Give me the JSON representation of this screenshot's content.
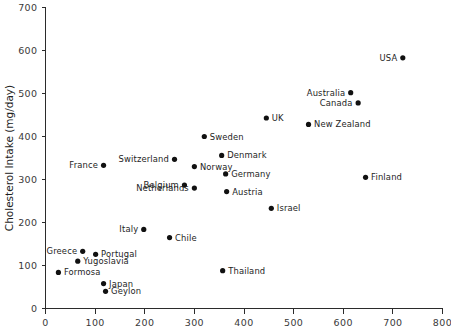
{
  "chart_data": {
    "type": "scatter",
    "title": "",
    "xlabel": "",
    "ylabel": "Cholesterol Intake (mg/day)",
    "xlim": [
      0,
      800
    ],
    "ylim": [
      0,
      700
    ],
    "xticks": [
      0,
      100,
      200,
      300,
      400,
      500,
      600,
      700,
      800
    ],
    "yticks": [
      0,
      100,
      200,
      300,
      400,
      500,
      600,
      700
    ],
    "grid": false,
    "legend": "none",
    "marker_color": "#111111",
    "axis_color": "#2b2b2b",
    "points": [
      {
        "label": "USA",
        "x": 720,
        "y": 583,
        "side": "left"
      },
      {
        "label": "Australia",
        "x": 615,
        "y": 502,
        "side": "left"
      },
      {
        "label": "Canada",
        "x": 630,
        "y": 478,
        "side": "left"
      },
      {
        "label": "UK",
        "x": 445,
        "y": 443,
        "side": "right"
      },
      {
        "label": "New Zealand",
        "x": 530,
        "y": 428,
        "side": "right"
      },
      {
        "label": "Sweden",
        "x": 320,
        "y": 400,
        "side": "right"
      },
      {
        "label": "Denmark",
        "x": 355,
        "y": 356,
        "side": "right"
      },
      {
        "label": "Switzerland",
        "x": 260,
        "y": 347,
        "side": "left"
      },
      {
        "label": "France",
        "x": 117,
        "y": 333,
        "side": "left"
      },
      {
        "label": "Norway",
        "x": 300,
        "y": 330,
        "side": "right"
      },
      {
        "label": "Germany",
        "x": 363,
        "y": 313,
        "side": "right"
      },
      {
        "label": "Finland",
        "x": 645,
        "y": 305,
        "side": "right"
      },
      {
        "label": "Belgium",
        "x": 280,
        "y": 287,
        "side": "left"
      },
      {
        "label": "Netherlands",
        "x": 300,
        "y": 280,
        "side": "left"
      },
      {
        "label": "Austria",
        "x": 365,
        "y": 272,
        "side": "right"
      },
      {
        "label": "Israel",
        "x": 455,
        "y": 233,
        "side": "right"
      },
      {
        "label": "Italy",
        "x": 198,
        "y": 184,
        "side": "left"
      },
      {
        "label": "Chile",
        "x": 250,
        "y": 165,
        "side": "right"
      },
      {
        "label": "Greece",
        "x": 75,
        "y": 133,
        "side": "left"
      },
      {
        "label": "Portugal",
        "x": 101,
        "y": 126,
        "side": "right"
      },
      {
        "label": "Yugoslavia",
        "x": 65,
        "y": 110,
        "side": "right"
      },
      {
        "label": "Formosa",
        "x": 26,
        "y": 84,
        "side": "right"
      },
      {
        "label": "Thailand",
        "x": 357,
        "y": 88,
        "side": "right"
      },
      {
        "label": "Japan",
        "x": 117,
        "y": 58,
        "side": "right"
      },
      {
        "label": "Geylon",
        "x": 121,
        "y": 40,
        "side": "right"
      }
    ]
  }
}
